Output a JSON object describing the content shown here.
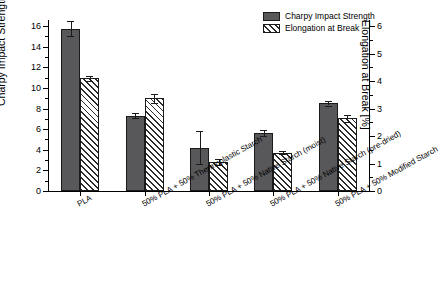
{
  "chart_data": {
    "type": "bar",
    "title": "",
    "categories": [
      "PLA",
      "50% PLA + 50% Thermoplastic Starch",
      "50% PLA + 50% Native Starch (moist)",
      "50% PLA + 50% Native Starch (pre-dried)",
      "50% PLA + 50% Modified Starch"
    ],
    "series": [
      {
        "name": "Charpy Impact Strength",
        "axis": "left",
        "unit": "kJ/m2",
        "values": [
          15.75,
          7.3,
          4.2,
          5.6,
          8.5
        ],
        "errors": [
          0.75,
          0.25,
          1.6,
          0.3,
          0.2
        ]
      },
      {
        "name": "Elongation at Break",
        "axis": "right",
        "unit": "%",
        "values": [
          4.1,
          3.37,
          1.05,
          1.4,
          2.65
        ],
        "errors": [
          0.1,
          0.15,
          0.1,
          0.05,
          0.12
        ]
      }
    ],
    "left_axis": {
      "label": "Charpy Impact Strength [kJ/m",
      "label_sup": "2",
      "label_tail": "]",
      "min": 0,
      "max": 16.6,
      "ticks": [
        0,
        2,
        4,
        6,
        8,
        10,
        12,
        14,
        16
      ],
      "tick_labels": [
        "0",
        "2",
        "4",
        "6",
        "8",
        "10",
        "12",
        "14",
        "16"
      ]
    },
    "right_axis": {
      "label": "Elongation at Break [%]",
      "min": 0,
      "max": 6.225,
      "ticks": [
        0,
        1,
        2,
        3,
        4,
        5,
        6
      ],
      "tick_labels": [
        "0",
        "1",
        "2",
        "3",
        "4",
        "5",
        "6"
      ]
    },
    "legend": {
      "position": "top-right",
      "entries": [
        {
          "label": "Charpy Impact Strength",
          "swatch": "solid"
        },
        {
          "label": "Elongation at Break",
          "swatch": "hatch"
        }
      ]
    },
    "grid": false
  },
  "caption": {
    "text": ""
  }
}
